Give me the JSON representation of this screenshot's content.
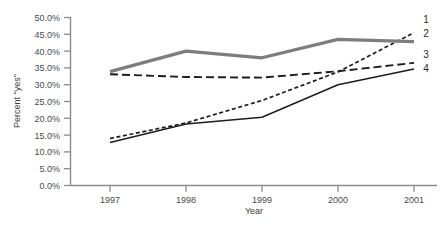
{
  "chart_data": {
    "type": "line",
    "title": "",
    "xlabel": "Year",
    "ylabel": "Percent \"yes\"",
    "categories": [
      "1997",
      "1998",
      "1999",
      "2000",
      "2001"
    ],
    "x": [
      1997,
      1998,
      1999,
      2000,
      2001
    ],
    "xlim": [
      1997,
      2001
    ],
    "ylim": [
      0,
      50
    ],
    "yticks": [
      0,
      5,
      10,
      15,
      20,
      25,
      30,
      35,
      40,
      45,
      50
    ],
    "ytick_labels": [
      "0.0%",
      "5.0%",
      "10.0%",
      "15.0%",
      "20.0%",
      "25.0%",
      "30.0%",
      "35.0%",
      "40.0%",
      "45.0%",
      "50.0%"
    ],
    "xtick_labels": [
      "1997",
      "1998",
      "1999",
      "2000",
      "2001"
    ],
    "grid": false,
    "legend_position": "right-end-of-line",
    "series": [
      {
        "name": "1",
        "label": "1",
        "style": "short-dashed",
        "color": "#1d1d1d",
        "width": 1.7,
        "dash": "4,2.6",
        "values": [
          14.0,
          18.6,
          25.3,
          33.8,
          45.5
        ]
      },
      {
        "name": "2",
        "label": "2",
        "style": "solid-thick-gray",
        "color": "#7d7d7d",
        "width": 3.2,
        "dash": "",
        "values": [
          33.9,
          40.0,
          38.0,
          43.5,
          42.8
        ]
      },
      {
        "name": "3",
        "label": "3",
        "style": "long-dashed",
        "color": "#1d1d1d",
        "width": 1.9,
        "dash": "8,4",
        "values": [
          33.1,
          32.3,
          32.1,
          34.0,
          36.5
        ]
      },
      {
        "name": "4",
        "label": "4",
        "style": "solid-thin",
        "color": "#1d1d1d",
        "width": 1.5,
        "dash": "",
        "values": [
          12.8,
          18.3,
          20.3,
          30.0,
          34.7
        ]
      }
    ]
  },
  "axis": {
    "y_label": "Percent \"yes\"",
    "x_label": "Year"
  },
  "colors": {
    "axis": "#8a8a8a",
    "text": "#3c3c3c",
    "series_gray": "#7d7d7d",
    "series_black": "#1d1d1d",
    "background": "#ffffff"
  }
}
